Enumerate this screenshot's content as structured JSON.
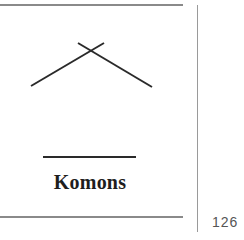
{
  "figure": {
    "label": "Komons",
    "glyph": "chevron-cross-symbol",
    "lines": [
      {
        "x1": 31,
        "y1": 86,
        "x2": 104,
        "y2": 43
      },
      {
        "x1": 78,
        "y1": 43,
        "x2": 152,
        "y2": 87
      }
    ],
    "stroke_color": "#2a2a2a"
  },
  "page": {
    "number": "126"
  }
}
